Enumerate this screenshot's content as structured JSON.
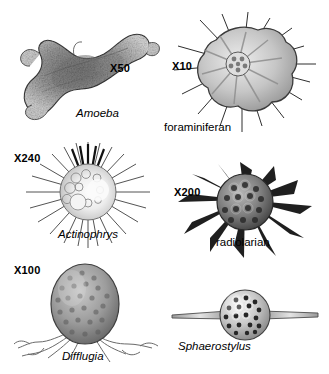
{
  "figure": {
    "type": "scientific-illustration-plate",
    "background_color": "#ffffff",
    "ink_color": "#000000"
  },
  "specimens": [
    {
      "id": "amoeba",
      "name": "Amoeba",
      "name_style": "italic",
      "magnification": "X50",
      "icon": "amoeba-illustration"
    },
    {
      "id": "foraminiferan",
      "name": "foraminiferan",
      "name_style": "roman",
      "magnification": "X10",
      "icon": "foraminiferan-illustration"
    },
    {
      "id": "actinophrys",
      "name": "Actinophrys",
      "name_style": "italic",
      "magnification": "X240",
      "icon": "actinophrys-illustration"
    },
    {
      "id": "radiolarian",
      "name": "radiolarian",
      "name_style": "roman",
      "magnification": "X200",
      "icon": "radiolarian-illustration"
    },
    {
      "id": "difflugia",
      "name": "Difflugia",
      "name_style": "italic",
      "magnification": "X100",
      "icon": "difflugia-illustration"
    },
    {
      "id": "sphaerostylus",
      "name": "Sphaerostylus",
      "name_style": "italic",
      "magnification": "",
      "icon": "sphaerostylus-illustration"
    }
  ]
}
